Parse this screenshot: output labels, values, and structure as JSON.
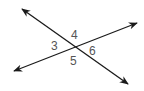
{
  "diagram": {
    "type": "intersecting-lines",
    "colors": {
      "line": "#1a1a1a",
      "label": "#555555",
      "background": "#ffffff"
    },
    "lines": [
      {
        "id": "line-1",
        "from": [
          22,
          9
        ],
        "to": [
          128,
          84
        ],
        "arrows": "both"
      },
      {
        "id": "line-2",
        "from": [
          14,
          71
        ],
        "to": [
          137,
          23
        ],
        "arrows": "both"
      }
    ],
    "intersection": [
      74,
      47
    ],
    "angle_labels": [
      {
        "label": "3",
        "x": 52,
        "y": 40
      },
      {
        "label": "4",
        "x": 72,
        "y": 29
      },
      {
        "label": "5",
        "x": 71,
        "y": 55
      },
      {
        "label": "6",
        "x": 89,
        "y": 45
      }
    ]
  }
}
